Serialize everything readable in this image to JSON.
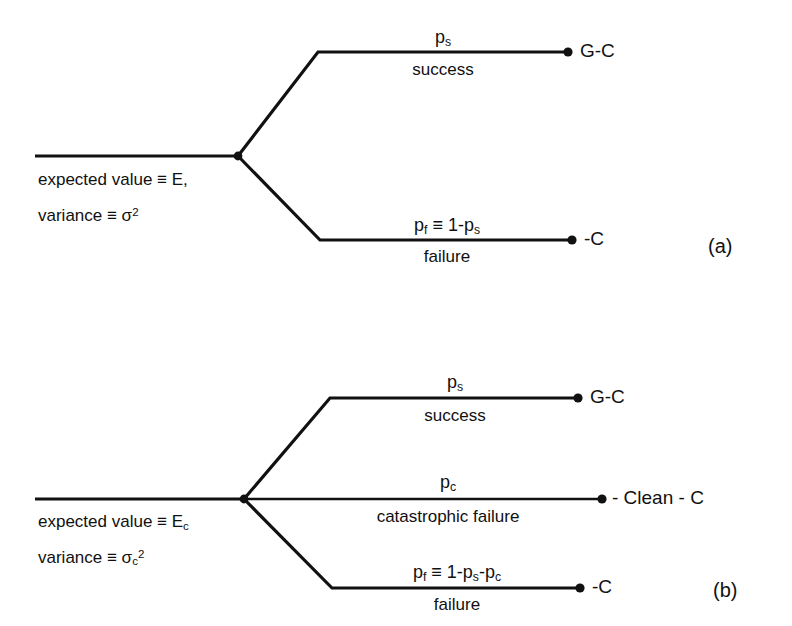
{
  "figure": {
    "type": "decision-tree-diagram",
    "panels": [
      {
        "tag": "(a)",
        "root": {
          "expected_value": "expected value ≡ E,",
          "variance_prefix": "variance ≡ σ",
          "variance_exponent": "2"
        },
        "branches": [
          {
            "name": "success",
            "prob_base": "p",
            "prob_sub": "s",
            "prob_tail": "",
            "outcome_label": "success",
            "terminal": "G-C"
          },
          {
            "name": "failure",
            "prob_base": "p",
            "prob_sub": "f",
            "prob_tail": " ≡ 1-p",
            "prob_tail_sub": "s",
            "outcome_label": "failure",
            "terminal": "-C"
          }
        ]
      },
      {
        "tag": "(b)",
        "root": {
          "expected_value_prefix": "expected value ≡ E",
          "expected_value_sub": "c",
          "variance_prefix": "variance ≡ σ",
          "variance_sub": "c",
          "variance_exponent": "2"
        },
        "branches": [
          {
            "name": "success",
            "prob_base": "p",
            "prob_sub": "s",
            "outcome_label": "success",
            "terminal": "G-C"
          },
          {
            "name": "catastrophic-failure",
            "prob_base": "p",
            "prob_sub": "c",
            "outcome_label": "catastrophic failure",
            "terminal": "- Clean - C"
          },
          {
            "name": "failure",
            "prob_base": "p",
            "prob_sub": "f",
            "prob_tail": " ≡ 1-p",
            "prob_tail_sub": "s",
            "prob_tail2": "-p",
            "prob_tail2_sub": "c",
            "outcome_label": "failure",
            "terminal": "-C"
          }
        ]
      }
    ],
    "colors": {
      "line": "#111111",
      "background": "#ffffff",
      "text": "#111111"
    }
  }
}
